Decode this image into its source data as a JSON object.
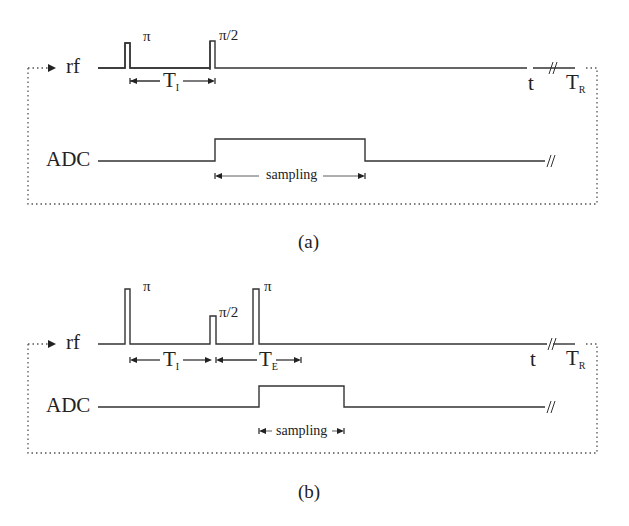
{
  "panels": [
    {
      "id": "a",
      "caption": "(a)",
      "rf_label": "rf",
      "adc_label": "ADC",
      "pulses": [
        {
          "label": "π",
          "type": "inversion"
        },
        {
          "label": "π/2",
          "type": "excitation"
        }
      ],
      "intervals": [
        {
          "main": "T",
          "sub": "I"
        }
      ],
      "sampling_label": "sampling",
      "time_label": "t",
      "repeat_label": {
        "main": "T",
        "sub": "R"
      }
    },
    {
      "id": "b",
      "caption": "(b)",
      "rf_label": "rf",
      "adc_label": "ADC",
      "pulses": [
        {
          "label": "π",
          "type": "inversion"
        },
        {
          "label": "π/2",
          "type": "excitation"
        },
        {
          "label": "π",
          "type": "refocusing"
        }
      ],
      "intervals": [
        {
          "main": "T",
          "sub": "I"
        },
        {
          "main": "T",
          "sub": "E"
        }
      ],
      "sampling_label": "sampling",
      "time_label": "t",
      "repeat_label": {
        "main": "T",
        "sub": "R"
      }
    }
  ],
  "colors": {
    "line": "#333333",
    "dotted": "#555555",
    "background": "#ffffff"
  }
}
